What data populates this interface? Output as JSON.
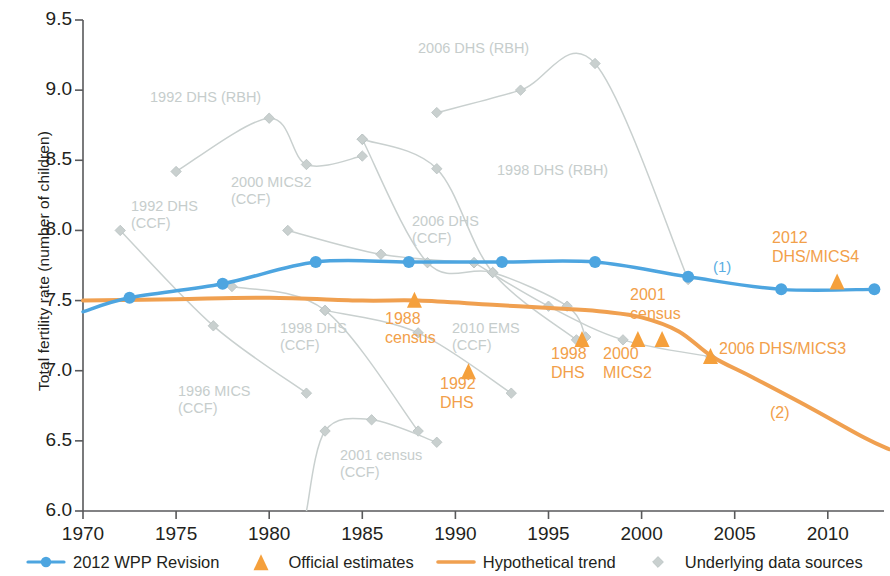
{
  "chart_data": {
    "type": "line",
    "title": "",
    "xlabel": "",
    "ylabel": "Total fertility rate (number of children)",
    "xlim": [
      1969,
      2013.5
    ],
    "ylim": [
      6.0,
      9.5
    ],
    "xticks": [
      1970,
      1975,
      1980,
      1985,
      1990,
      1995,
      2000,
      2005,
      2010
    ],
    "yticks": [
      "6.0",
      "6.5",
      "7.0",
      "7.5",
      "8.0",
      "8.5",
      "9.0",
      "9.5"
    ],
    "grid": false,
    "legend_position": "bottom",
    "colors": {
      "wpp_blue": "#4da5e0",
      "official_orange": "#f5a03c",
      "trend_orange": "#f0a050",
      "sources_gray": "#c9d0cf",
      "axis": "#58595b"
    },
    "series": [
      {
        "name": "2012 WPP Revision",
        "style": "line-markers",
        "color": "#4da5e0",
        "x": [
          1970.0,
          1972.5,
          1977.5,
          1982.5,
          1987.5,
          1992.5,
          1997.5,
          2002.5,
          2007.5,
          2012.5
        ],
        "values": [
          7.42,
          7.52,
          7.62,
          7.775,
          7.775,
          7.775,
          7.775,
          7.67,
          7.58,
          7.58
        ],
        "marker_x": [
          1972.5,
          1977.5,
          1982.5,
          1987.5,
          1992.5,
          1997.5,
          2002.5,
          2007.5,
          2012.5
        ],
        "marker_values": [
          7.52,
          7.62,
          7.775,
          7.775,
          7.775,
          7.775,
          7.67,
          7.58,
          7.58
        ]
      },
      {
        "name": "Hypothetical trend",
        "style": "line",
        "color": "#f0a050",
        "x": [
          1970.0,
          1975.0,
          1980.0,
          1985.0,
          1988.0,
          1992.0,
          1996.0,
          1998.0,
          2000.0,
          2002.0,
          2003.8,
          2006.0,
          2009.0,
          2012.0,
          2013.3
        ],
        "values": [
          7.5,
          7.51,
          7.52,
          7.5,
          7.5,
          7.47,
          7.44,
          7.42,
          7.38,
          7.28,
          7.1,
          6.95,
          6.74,
          6.52,
          6.44
        ]
      },
      {
        "name": "Official estimates",
        "style": "markers",
        "color": "#f5a03c",
        "points": [
          {
            "label": "1988 census",
            "x": 1987.8,
            "y": 7.5
          },
          {
            "label": "1992 DHS",
            "x": 1990.7,
            "y": 6.99
          },
          {
            "label": "1998 DHS",
            "x": 1996.8,
            "y": 7.22
          },
          {
            "label": "2000 MICS2",
            "x": 1999.8,
            "y": 7.22
          },
          {
            "label": "2001 census",
            "x": 2001.1,
            "y": 7.22
          },
          {
            "label": "2006 DHS/MICS3",
            "x": 2003.7,
            "y": 7.1
          },
          {
            "label": "2012 DHS/MICS4",
            "x": 2010.5,
            "y": 7.63
          }
        ]
      },
      {
        "name": "1992 DHS (RBH)",
        "style": "line-markers",
        "color": "#c9d0cf",
        "x": [
          1975.0,
          1980.0,
          1982.0,
          1985.0
        ],
        "values": [
          8.42,
          8.8,
          8.47,
          8.53
        ]
      },
      {
        "name": "1992 DHS (CCF)",
        "style": "line-markers",
        "color": "#c9d0cf",
        "x": [
          1972.0,
          1977.0,
          1982.0
        ],
        "values": [
          8.0,
          7.32,
          6.84
        ]
      },
      {
        "name": "1996 MICS (CCF)",
        "style": "line-markers",
        "color": "#c9d0cf",
        "x": [
          1978.0,
          1983.0,
          1988.0
        ],
        "values": [
          7.6,
          7.43,
          6.57
        ]
      },
      {
        "name": "2000 MICS2 (CCF)",
        "style": "line-markers",
        "color": "#c9d0cf",
        "x": [
          1981.0,
          1986.0,
          1991.0
        ],
        "values": [
          8.0,
          7.83,
          7.77
        ]
      },
      {
        "name": "1998 DHS (CCF)",
        "style": "line-markers",
        "color": "#c9d0cf",
        "x": [
          1983.0,
          1988.0,
          1993.0
        ],
        "values": [
          7.43,
          7.27,
          6.84
        ]
      },
      {
        "name": "2006 DHS (CCF)",
        "style": "line-markers",
        "color": "#c9d0cf",
        "x": [
          1985.0,
          1988.5,
          1992.0,
          1996.0,
          1997.0
        ],
        "values": [
          8.65,
          7.77,
          7.7,
          7.46,
          7.24
        ]
      },
      {
        "name": "1998 DHS (RBH)",
        "style": "line-markers",
        "color": "#c9d0cf",
        "x": [
          1985.0,
          1989.0,
          1992.0,
          1996.5
        ],
        "values": [
          8.65,
          8.44,
          7.7,
          7.22
        ]
      },
      {
        "name": "2006 DHS (RBH)",
        "style": "line-markers",
        "color": "#c9d0cf",
        "x": [
          1989.0,
          1993.5,
          1997.5,
          2002.5
        ],
        "values": [
          8.84,
          9.0,
          9.19,
          7.65
        ]
      },
      {
        "name": "2010 EMS (CCF)",
        "style": "line-markers",
        "color": "#c9d0cf",
        "x": [
          1991.0,
          1995.0,
          1999.0,
          2003.7
        ],
        "values": [
          7.77,
          7.46,
          7.22,
          7.1
        ]
      },
      {
        "name": "2001 census (CCF)",
        "style": "line-markers",
        "color": "#c9d0cf",
        "x": [
          1982.0,
          1983.0,
          1985.5,
          1989.0
        ],
        "values": [
          6.0,
          6.57,
          6.65,
          6.49
        ]
      }
    ],
    "annotations": [
      {
        "id": "ann-1992-dhs-rbh",
        "text": "1992 DHS (RBH)",
        "color": "gray",
        "x": 150,
        "y": 89
      },
      {
        "id": "ann-1992-dhs-ccf",
        "text": "1992 DHS\n(CCF)",
        "color": "gray",
        "x": 131,
        "y": 198
      },
      {
        "id": "ann-2000-mics2-ccf",
        "text": "2000 MICS2\n(CCF)",
        "color": "gray",
        "x": 231,
        "y": 174
      },
      {
        "id": "ann-1996-mics-ccf",
        "text": "1996 MICS\n(CCF)",
        "color": "gray",
        "x": 178,
        "y": 383
      },
      {
        "id": "ann-1998-dhs-ccf",
        "text": "1998 DHS\n(CCF)",
        "color": "gray",
        "x": 280,
        "y": 320
      },
      {
        "id": "ann-2006-dhs-ccf",
        "text": "2006 DHS\n(CCF)",
        "color": "gray",
        "x": 412,
        "y": 213
      },
      {
        "id": "ann-2006-dhs-rbh",
        "text": "2006 DHS (RBH)",
        "color": "gray",
        "x": 418,
        "y": 40
      },
      {
        "id": "ann-1998-dhs-rbh",
        "text": "1998 DHS (RBH)",
        "color": "gray",
        "x": 497,
        "y": 162
      },
      {
        "id": "ann-2010-ems-ccf",
        "text": "2010 EMS\n(CCF)",
        "color": "gray",
        "x": 452,
        "y": 320
      },
      {
        "id": "ann-2001-census-ccf",
        "text": "2001 census\n(CCF)",
        "color": "gray",
        "x": 340,
        "y": 447
      },
      {
        "id": "ann-1988-census",
        "text": "1988\ncensus",
        "color": "orange",
        "x": 385,
        "y": 309
      },
      {
        "id": "ann-1992-dhs",
        "text": "1992\nDHS",
        "color": "orange",
        "x": 440,
        "y": 374
      },
      {
        "id": "ann-1998-dhs",
        "text": "1998\nDHS",
        "color": "orange",
        "x": 551,
        "y": 344
      },
      {
        "id": "ann-2000-mics2",
        "text": "2000\nMICS2",
        "color": "orange",
        "x": 603,
        "y": 344
      },
      {
        "id": "ann-2001-census",
        "text": "2001\ncensus",
        "color": "orange",
        "x": 630,
        "y": 285
      },
      {
        "id": "ann-2006-dhs-mics3",
        "text": "2006 DHS/MICS3",
        "color": "orange",
        "x": 719,
        "y": 339
      },
      {
        "id": "ann-2012-dhs-mics4",
        "text": "2012\nDHS/MICS4",
        "color": "orange",
        "x": 772,
        "y": 228
      },
      {
        "id": "ann-note-1",
        "text": "(1)",
        "color": "blue",
        "x": 713,
        "y": 258
      },
      {
        "id": "ann-note-2",
        "text": "(2)",
        "color": "orange",
        "x": 770,
        "y": 403
      }
    ],
    "legend": [
      {
        "label": "2012 WPP Revision",
        "glyph": "line-circle-marker",
        "color": "#4da5e0"
      },
      {
        "label": "Official estimates",
        "glyph": "triangle-marker",
        "color": "#f5a03c"
      },
      {
        "label": "Hypothetical trend",
        "glyph": "line",
        "color": "#f0a050"
      },
      {
        "label": "Underlying data sources",
        "glyph": "diamond-marker",
        "color": "#c9d0cf"
      }
    ]
  }
}
